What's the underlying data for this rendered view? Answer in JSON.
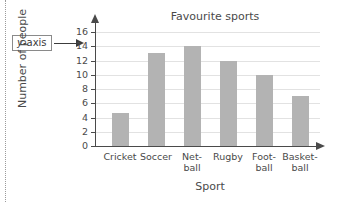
{
  "callout": {
    "label_italic": "y",
    "label_rest": "-axis",
    "arrow": "right-arrow"
  },
  "chart_data": {
    "type": "bar",
    "title": "Favourite sports",
    "xlabel": "Sport",
    "ylabel": "Number of people",
    "categories": [
      "Cricket",
      "Soccer",
      "Net-\nball",
      "Rugby",
      "Foot-\nball",
      "Basket-\nball"
    ],
    "category_plain": [
      "Cricket",
      "Soccer",
      "Netball",
      "Rugby",
      "Football",
      "Basketball"
    ],
    "values": [
      4.7,
      13,
      14,
      12,
      10,
      7
    ],
    "ylim": [
      0,
      16
    ],
    "ytick_step": 2,
    "yticks": [
      "0",
      "2",
      "4",
      "6",
      "8",
      "10",
      "12",
      "14",
      "16"
    ],
    "grid": true,
    "legend": "none",
    "bar_color": "#b3b3b3",
    "axis_color": "#4a4a4a",
    "grid_color": "#e2e2e2"
  }
}
